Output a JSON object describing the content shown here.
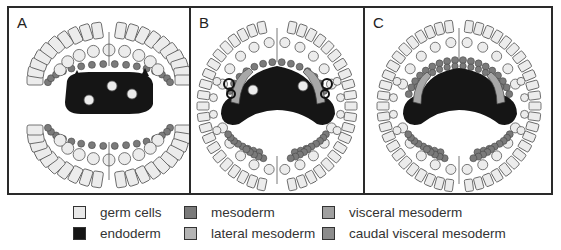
{
  "figure": {
    "panels": [
      {
        "label": "A",
        "stage": "early"
      },
      {
        "label": "B",
        "stage": "mid"
      },
      {
        "label": "C",
        "stage": "late"
      }
    ]
  },
  "legend": {
    "items": [
      {
        "label": "germ cells",
        "color": "#e8e8e8",
        "key": "germ-cells"
      },
      {
        "label": "mesoderm",
        "color": "#7a7a7a",
        "key": "mesoderm"
      },
      {
        "label": "visceral mesoderm",
        "color": "#a0a0a0",
        "key": "visceral-mesoderm"
      },
      {
        "label": "endoderm",
        "color": "#151515",
        "key": "endoderm"
      },
      {
        "label": "lateral mesoderm",
        "color": "#b4b4b4",
        "key": "lateral-mesoderm"
      },
      {
        "label": "caudal visceral mesoderm",
        "color": "#8c8c8c",
        "key": "caudal-visceral-mesoderm"
      }
    ]
  },
  "colors": {
    "frame": "#2a2a2a",
    "ectoderm_fill": "#ececec",
    "cell_outline": "#555555",
    "endoderm": "#151515",
    "mesoderm": "#7a7a7a",
    "lateral_mesoderm": "#a8a8a8"
  }
}
